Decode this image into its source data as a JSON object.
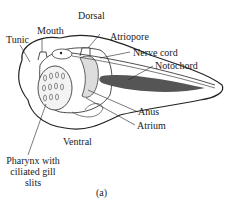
{
  "labels": {
    "dorsal": "Dorsal",
    "mouth": "Mouth",
    "tunic": "Tunic",
    "atriopore": "Atriopore",
    "nerve_cord": "Nerve cord",
    "notochord": "Notochord",
    "anus": "Anus",
    "atrium": "Atrium",
    "ventral": "Ventral",
    "pharynx_line1": "Pharynx with",
    "pharynx_line2": "ciliated gill",
    "pharynx_line3": "slits",
    "caption": "(a)"
  },
  "colors": {
    "line": "#222222",
    "notochord": "#555555",
    "shade": "#cccccc"
  }
}
